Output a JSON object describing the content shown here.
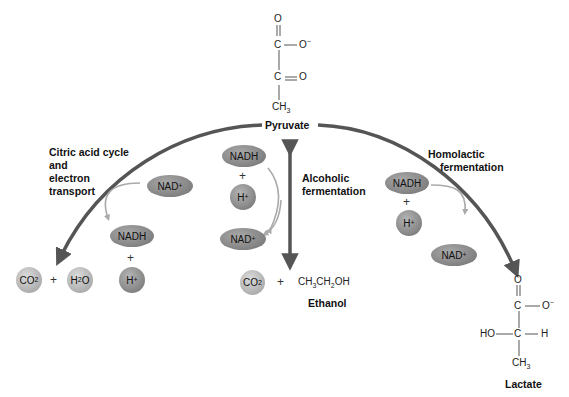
{
  "pyruvate": {
    "label": "Pyruvate",
    "structure": {
      "o_top": "O",
      "c1": "C",
      "o_minus": "O",
      "o_minus_charge": "−",
      "c2": "C",
      "o_double": "O",
      "ch3": "CH",
      "ch3_sub": "3"
    }
  },
  "pathways": {
    "citric": {
      "label_lines": [
        "Citric acid cycle",
        "and",
        "electron",
        "transport"
      ],
      "cofactor_in": {
        "text": "NAD",
        "sup": "+"
      },
      "cofactor_out": {
        "text": "NADH",
        "plus": "+",
        "proton": "H",
        "proton_sup": "+"
      },
      "products": {
        "co2": {
          "text": "CO",
          "sub": "2"
        },
        "plus": "+",
        "h2o": {
          "pre": "H",
          "sub": "2",
          "post": "O"
        }
      }
    },
    "alcoholic": {
      "label_lines": [
        "Alcoholic",
        "fermentation"
      ],
      "cofactor_in": {
        "text": "NADH",
        "plus": "+",
        "proton": "H",
        "proton_sup": "+"
      },
      "cofactor_out": {
        "text": "NAD",
        "sup": "+"
      },
      "products": {
        "co2": {
          "text": "CO",
          "sub": "2"
        },
        "plus": "+",
        "ethanol_formula": {
          "a": "CH",
          "a_sub": "3",
          "b": "CH",
          "b_sub": "2",
          "c": "OH"
        },
        "ethanol_label": "Ethanol"
      }
    },
    "homolactic": {
      "label_lines": [
        "Homolactic",
        "fermentation"
      ],
      "cofactor_in": {
        "text": "NADH",
        "plus": "+",
        "proton": "H",
        "proton_sup": "+"
      },
      "cofactor_out": {
        "text": "NAD",
        "sup": "+"
      }
    }
  },
  "lactate": {
    "label": "Lactate",
    "structure": {
      "o_top": "O",
      "c1": "C",
      "o_minus": "O",
      "o_minus_charge": "−",
      "ho": "HO",
      "c2": "C",
      "h": "H",
      "ch3": "CH",
      "ch3_sub": "3"
    }
  },
  "colors": {
    "main_arrow": "#555555",
    "cofactor_arrow": "#a8a8a8",
    "ellipse": "#8a8a8a",
    "sphere_light": "#c0c0c0",
    "sphere_dark": "#8e8e8e"
  }
}
